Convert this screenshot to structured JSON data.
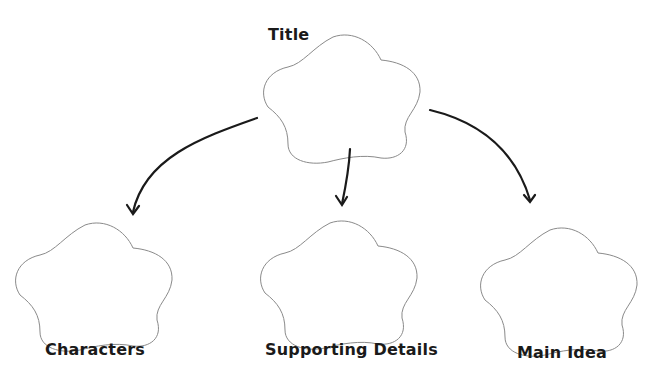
{
  "diagram": {
    "type": "graphic-organizer",
    "nodes": [
      {
        "id": "title",
        "label": "Title"
      },
      {
        "id": "characters",
        "label": "Characters"
      },
      {
        "id": "supporting",
        "label": "Supporting Details"
      },
      {
        "id": "main",
        "label": "Main Idea"
      }
    ],
    "edges": [
      {
        "from": "title",
        "to": "characters"
      },
      {
        "from": "title",
        "to": "supporting"
      },
      {
        "from": "title",
        "to": "main"
      }
    ],
    "colors": {
      "shape_stroke": "#8a8a8a",
      "arrow": "#1a1a1a",
      "text": "#1a1a1a",
      "background": "#ffffff"
    }
  }
}
